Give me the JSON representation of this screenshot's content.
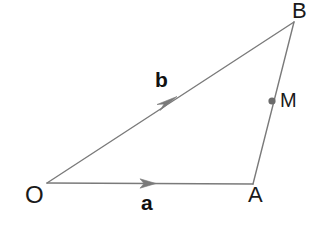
{
  "diagram": {
    "background_color": "#ffffff",
    "line_color": "#7a7a7a",
    "label_color": "#1a1a1a",
    "vector_label_color": "#111111",
    "point_marker_color": "#6b6b6b",
    "width": 333,
    "height": 233,
    "points": [
      {
        "id": "O",
        "label": "O",
        "x": 47,
        "y": 183
      },
      {
        "id": "A",
        "label": "A",
        "x": 253,
        "y": 184
      },
      {
        "id": "B",
        "label": "B",
        "x": 294,
        "y": 22
      },
      {
        "id": "M",
        "label": "M",
        "x": 272,
        "y": 101
      }
    ],
    "segments": [
      {
        "id": "OA",
        "from": "O",
        "to": "A",
        "arrow": true,
        "vector_label": "a"
      },
      {
        "id": "OB",
        "from": "O",
        "to": "B",
        "arrow": true,
        "vector_label": "b"
      },
      {
        "id": "AB",
        "from": "A",
        "to": "B",
        "arrow": false,
        "vector_label": ""
      }
    ],
    "labels": {
      "point_O": "O",
      "point_A": "A",
      "point_B": "B",
      "point_M": "M",
      "vector_a": "a",
      "vector_b": "b"
    }
  }
}
